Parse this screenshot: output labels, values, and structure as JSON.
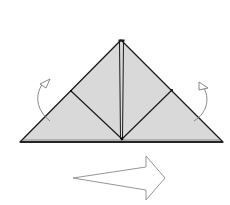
{
  "diagram": {
    "type": "origami-fold-step",
    "colors": {
      "background": "#ffffff",
      "paper_fill": "#d9d9d9",
      "outline": "#1a1a1a",
      "arrow_stroke": "#8a8a8a",
      "turn_arrow_stroke": "#7a7a7a"
    },
    "shape": {
      "apex": [
        121,
        40
      ],
      "base_left": [
        20,
        142
      ],
      "base_right": [
        223,
        142
      ],
      "center_bottom": [
        122,
        139
      ]
    },
    "creases": [
      {
        "name": "left-inner-crease",
        "from": [
          71,
          91
        ],
        "to": [
          122,
          139
        ]
      },
      {
        "name": "right-inner-crease",
        "from": [
          172,
          90
        ],
        "to": [
          122,
          139
        ]
      },
      {
        "name": "center-crease-left",
        "from": [
          120,
          41
        ],
        "to": [
          120,
          139
        ]
      },
      {
        "name": "center-crease-right",
        "from": [
          123,
          41
        ],
        "to": [
          123,
          139
        ]
      }
    ],
    "annotations": [
      {
        "name": "left-fold-behind-arrow",
        "meaning": "fold behind / turn"
      },
      {
        "name": "right-fold-behind-arrow",
        "meaning": "fold behind / turn"
      },
      {
        "name": "next-step-arrow",
        "meaning": "proceed to next step"
      }
    ]
  }
}
